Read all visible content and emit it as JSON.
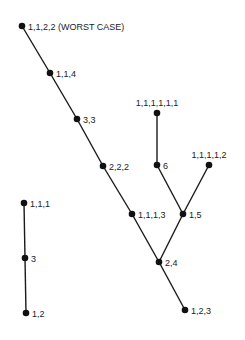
{
  "diagram": {
    "type": "tree",
    "nodes": [
      {
        "id": "n1122",
        "label": "1,1,2,2 (WORST CASE)",
        "x": 22,
        "y": 26
      },
      {
        "id": "n114",
        "label": "1,1,4",
        "x": 50,
        "y": 73
      },
      {
        "id": "n33",
        "label": "3,3",
        "x": 77,
        "y": 119
      },
      {
        "id": "n222",
        "label": "2,2,2",
        "x": 103,
        "y": 166
      },
      {
        "id": "n1113",
        "label": "1,1,1,3",
        "x": 132,
        "y": 214
      },
      {
        "id": "n24",
        "label": "2,4",
        "x": 159,
        "y": 262
      },
      {
        "id": "n123",
        "label": "1,2,3",
        "x": 185,
        "y": 310
      },
      {
        "id": "n111111",
        "label": "1,1,1,1,1,1",
        "x": 157,
        "y": 113
      },
      {
        "id": "n6",
        "label": "6",
        "x": 157,
        "y": 165
      },
      {
        "id": "n11112",
        "label": "1,1,1,1,2",
        "x": 209,
        "y": 165
      },
      {
        "id": "n15",
        "label": "1,5",
        "x": 183,
        "y": 214
      },
      {
        "id": "n111",
        "label": "1,1,1",
        "x": 24,
        "y": 203
      },
      {
        "id": "n3",
        "label": "3",
        "x": 25,
        "y": 258
      },
      {
        "id": "n12",
        "label": "1,2",
        "x": 26,
        "y": 313
      }
    ],
    "edges": [
      [
        "n1122",
        "n114"
      ],
      [
        "n114",
        "n33"
      ],
      [
        "n33",
        "n222"
      ],
      [
        "n222",
        "n1113"
      ],
      [
        "n1113",
        "n24"
      ],
      [
        "n24",
        "n123"
      ],
      [
        "n111111",
        "n6"
      ],
      [
        "n6",
        "n15"
      ],
      [
        "n11112",
        "n15"
      ],
      [
        "n15",
        "n24"
      ],
      [
        "n111",
        "n3"
      ],
      [
        "n3",
        "n12"
      ]
    ]
  }
}
